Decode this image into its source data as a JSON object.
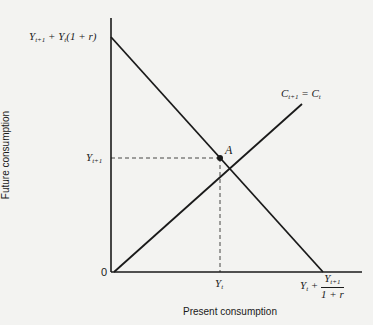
{
  "diagram": {
    "axes": {
      "x_label": "Present consumption",
      "y_label": "Future consumption",
      "origin_label": "0"
    },
    "y_intercept_label": {
      "Y": "Y",
      "t1": "t+1",
      "plus": " + ",
      "Y2": "Y",
      "t": "t",
      "paren": "(1 + r)"
    },
    "y_tick_label": {
      "Y": "Y",
      "sub": "t+1"
    },
    "x_tick_label": {
      "Y": "Y",
      "sub": "t"
    },
    "x_intercept_label": {
      "Y": "Y",
      "t": "t",
      "plus": " + ",
      "num_Y": "Y",
      "num_sub": "t+1",
      "den": "1 + r"
    },
    "line_label": {
      "C1": "C",
      "s1": "t+1",
      "eq": " = ",
      "C2": "C",
      "s2": "t"
    },
    "point_label": "A",
    "colors": {
      "line": "#1a1a1a",
      "background": "#f3f3f1"
    }
  }
}
